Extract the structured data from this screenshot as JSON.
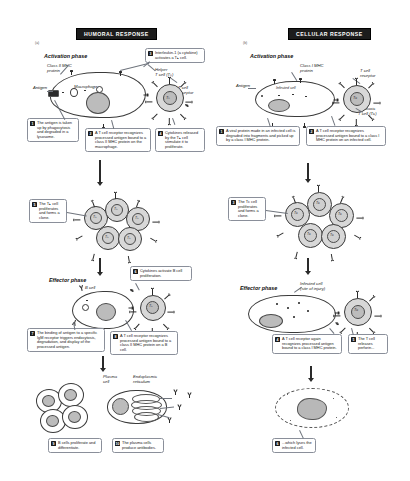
{
  "figure": {
    "title_left": "HUMORAL RESPONSE",
    "title_right": "CELLULAR RESPONSE",
    "page_marker_left": "(a)",
    "page_marker_right": "(b)"
  },
  "humoral": {
    "banner": "HUMORAL RESPONSE",
    "phases": {
      "activation": "Activation phase",
      "effector": "Effector phase"
    },
    "labels": {
      "class_ii_mhc": "Class II MHC\nprotein",
      "antigen": "Antigen",
      "macrophage": "Macrophage",
      "helper_t": "Helper\nT cell (Tₕ)",
      "t_cell_receptor": "T cell\nreceptor",
      "b_cell": "B cell",
      "plasma_cell": "Plasma\ncell",
      "endoplasmic_reticulum": "Endoplasmic\nreticulum",
      "th_glyph": "Tₕ",
      "b_glyph": "B"
    },
    "steps": [
      {
        "n": "1",
        "text": "The antigen is taken up by phagocytosis and degraded in a lysosome."
      },
      {
        "n": "2",
        "text": "A T cell receptor recognizes processed antigen bound to a class II MHC protein on the macrophage."
      },
      {
        "n": "3",
        "text": "Interleukin-1 (a cytokine) activates a Tₕ cell."
      },
      {
        "n": "4",
        "text": "Cytokines released by the Tₕ cell stimulate it to proliferate."
      },
      {
        "n": "5",
        "text": "The Tₕ cell proliferates and forms a clone."
      },
      {
        "n": "6",
        "text": "Cytokines activate B cell proliferation."
      },
      {
        "n": "7",
        "text": "The binding of antigen to a specific IgM receptor triggers endocytosis, degradation, and display of the processed antigen."
      },
      {
        "n": "8",
        "text": "A T cell receptor recognizes processed antigen bound to a class II MHC protein on a B cell."
      },
      {
        "n": "9",
        "text": "B cells proliferate and differentiate."
      },
      {
        "n": "10",
        "text": "The plasma cells produce antibodies."
      }
    ]
  },
  "cellular": {
    "banner": "CELLULAR RESPONSE",
    "phases": {
      "activation": "Activation phase",
      "effector": "Effector phase"
    },
    "labels": {
      "class_i_mhc": "Class I MHC\nprotein",
      "antigen": "Antigen",
      "infected_cell": "Infected cell",
      "t_cell_receptor": "T cell\nreceptor",
      "cytotoxic_t": "Cytotoxic\nT cell (Tᴄ)",
      "infected_cell_injury": "Infected cell\n(site of injury)",
      "tc_glyph": "Tᴄ"
    },
    "steps": [
      {
        "n": "1",
        "text": "A viral protein made in an infected cell is degraded into fragments and picked up by a class I MHC protein."
      },
      {
        "n": "2",
        "text": "A T cell receptor recognizes processed antigen bound to a class I MHC protein on an infected cell."
      },
      {
        "n": "3",
        "text": "The Tᴄ cell proliferates and forms a clone."
      },
      {
        "n": "4",
        "text": "A T cell receptor again recognizes processed antigen bound to a class I MHC protein."
      },
      {
        "n": "5",
        "text": "The T cell releases perforin..."
      },
      {
        "n": "6",
        "text": "...which lyses the infected cell."
      }
    ]
  }
}
